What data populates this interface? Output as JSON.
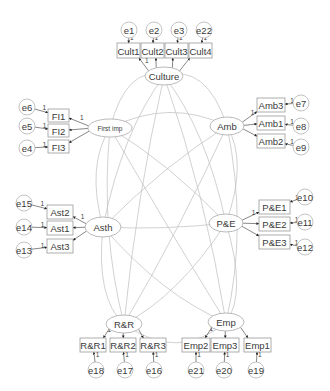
{
  "diagram": {
    "type": "structural-equation-model",
    "latents": [
      {
        "id": "culture",
        "label": "Culture",
        "cx": 164,
        "cy": 76,
        "rx": 19,
        "ry": 9
      },
      {
        "id": "firstimp",
        "label": "First imp",
        "cx": 110,
        "cy": 128,
        "rx": 22,
        "ry": 9
      },
      {
        "id": "amb",
        "label": "Amb",
        "cx": 227,
        "cy": 126,
        "rx": 17,
        "ry": 9
      },
      {
        "id": "asth",
        "label": "Asth",
        "cx": 103,
        "cy": 227,
        "rx": 18,
        "ry": 10
      },
      {
        "id": "pe",
        "label": "P&E",
        "cx": 226,
        "cy": 223,
        "rx": 17,
        "ry": 9
      },
      {
        "id": "rr",
        "label": "R&R",
        "cx": 124,
        "cy": 324,
        "rx": 18,
        "ry": 9
      },
      {
        "id": "emp",
        "label": "Emp",
        "cx": 226,
        "cy": 322,
        "rx": 18,
        "ry": 9
      }
    ],
    "indicators": [
      {
        "label": "Cult1",
        "x": 117,
        "y": 43,
        "w": 23,
        "h": 15,
        "factor": "culture",
        "error": "e1"
      },
      {
        "label": "Cult2",
        "x": 141,
        "y": 43,
        "w": 23,
        "h": 15,
        "factor": "culture",
        "error": "e2"
      },
      {
        "label": "Cult3",
        "x": 165,
        "y": 43,
        "w": 23,
        "h": 15,
        "factor": "culture",
        "error": "e3"
      },
      {
        "label": "Cult4",
        "x": 189,
        "y": 43,
        "w": 23,
        "h": 15,
        "factor": "culture",
        "error": "e22"
      },
      {
        "label": "FI1",
        "x": 48,
        "y": 109,
        "w": 21,
        "h": 13,
        "factor": "firstimp",
        "error": "e6"
      },
      {
        "label": "FI2",
        "x": 48,
        "y": 124,
        "w": 21,
        "h": 13,
        "factor": "firstimp",
        "error": "e5"
      },
      {
        "label": "FI3",
        "x": 48,
        "y": 140,
        "w": 21,
        "h": 13,
        "factor": "firstimp",
        "error": "e4"
      },
      {
        "label": "Amb3",
        "x": 257,
        "y": 98,
        "w": 28,
        "h": 14,
        "factor": "amb",
        "error": "e7"
      },
      {
        "label": "Amb1",
        "x": 257,
        "y": 116,
        "w": 28,
        "h": 14,
        "factor": "amb",
        "error": "e8"
      },
      {
        "label": "Amb2",
        "x": 257,
        "y": 134,
        "w": 28,
        "h": 14,
        "factor": "amb",
        "error": "e9"
      },
      {
        "label": "Ast2",
        "x": 47,
        "y": 205,
        "w": 26,
        "h": 14,
        "factor": "asth",
        "error": "e15"
      },
      {
        "label": "Ast1",
        "x": 47,
        "y": 221,
        "w": 26,
        "h": 14,
        "factor": "asth",
        "error": "e14"
      },
      {
        "label": "Ast3",
        "x": 47,
        "y": 239,
        "w": 26,
        "h": 14,
        "factor": "asth",
        "error": "e13"
      },
      {
        "label": "P&E1",
        "x": 259,
        "y": 200,
        "w": 31,
        "h": 14,
        "factor": "pe",
        "error": "e10"
      },
      {
        "label": "P&E2",
        "x": 259,
        "y": 217,
        "w": 31,
        "h": 14,
        "factor": "pe",
        "error": "e11"
      },
      {
        "label": "P&E3",
        "x": 259,
        "y": 235,
        "w": 31,
        "h": 14,
        "factor": "pe",
        "error": "e12"
      },
      {
        "label": "R&R1",
        "x": 80,
        "y": 338,
        "w": 26,
        "h": 14,
        "factor": "rr",
        "error": "e18"
      },
      {
        "label": "R&R2",
        "x": 110,
        "y": 338,
        "w": 26,
        "h": 14,
        "factor": "rr",
        "error": "e17"
      },
      {
        "label": "R&R3",
        "x": 140,
        "y": 338,
        "w": 26,
        "h": 14,
        "factor": "rr",
        "error": "e16"
      },
      {
        "label": "Emp2",
        "x": 182,
        "y": 338,
        "w": 28,
        "h": 14,
        "factor": "emp",
        "error": "e21"
      },
      {
        "label": "Emp3",
        "x": 211,
        "y": 338,
        "w": 28,
        "h": 14,
        "factor": "emp",
        "error": "e20"
      },
      {
        "label": "Emp1",
        "x": 244,
        "y": 338,
        "w": 27,
        "h": 14,
        "factor": "emp",
        "error": "e19"
      }
    ],
    "errors": [
      {
        "label": "e1",
        "cx": 129,
        "cy": 30
      },
      {
        "label": "e2",
        "cx": 154,
        "cy": 30
      },
      {
        "label": "e3",
        "cx": 179,
        "cy": 30
      },
      {
        "label": "e22",
        "cx": 204,
        "cy": 30
      },
      {
        "label": "e6",
        "cx": 27,
        "cy": 107
      },
      {
        "label": "e5",
        "cx": 27,
        "cy": 126
      },
      {
        "label": "e4",
        "cx": 27,
        "cy": 148
      },
      {
        "label": "e7",
        "cx": 301,
        "cy": 103
      },
      {
        "label": "e8",
        "cx": 301,
        "cy": 126
      },
      {
        "label": "e9",
        "cx": 301,
        "cy": 147
      },
      {
        "label": "e15",
        "cx": 24,
        "cy": 203
      },
      {
        "label": "e14",
        "cx": 24,
        "cy": 227
      },
      {
        "label": "e13",
        "cx": 24,
        "cy": 250
      },
      {
        "label": "e10",
        "cx": 305,
        "cy": 197
      },
      {
        "label": "e11",
        "cx": 305,
        "cy": 222
      },
      {
        "label": "e12",
        "cx": 305,
        "cy": 247
      },
      {
        "label": "e18",
        "cx": 96,
        "cy": 370
      },
      {
        "label": "e17",
        "cx": 125,
        "cy": 370
      },
      {
        "label": "e16",
        "cx": 154,
        "cy": 370
      },
      {
        "label": "e21",
        "cx": 196,
        "cy": 370
      },
      {
        "label": "e20",
        "cx": 224,
        "cy": 370
      },
      {
        "label": "e19",
        "cx": 256,
        "cy": 370
      }
    ],
    "fixed_loading_label": "1",
    "error_path_label": "1"
  }
}
